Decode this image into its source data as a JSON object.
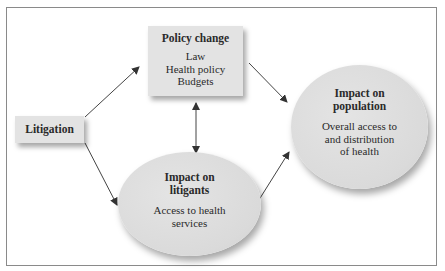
{
  "diagram": {
    "nodes": {
      "policy_change": {
        "title": "Policy change",
        "items": [
          "Law",
          "Health policy",
          "Budgets"
        ],
        "shape": "rectangle"
      },
      "litigation": {
        "title": "Litigation",
        "shape": "rectangle"
      },
      "impact_on_litigants": {
        "title_lines": [
          "Impact on",
          "litigants"
        ],
        "body_lines": [
          "Access to health",
          "services"
        ],
        "shape": "ellipse"
      },
      "impact_on_population": {
        "title_lines": [
          "Impact on",
          "population"
        ],
        "body_lines": [
          "Overall access to",
          "and distribution",
          "of health"
        ],
        "shape": "ellipse"
      }
    },
    "edges": [
      {
        "from": "Litigation",
        "to": "Policy change",
        "direction": "one-way"
      },
      {
        "from": "Litigation",
        "to": "Impact on litigants",
        "direction": "one-way"
      },
      {
        "from": "Policy change",
        "to": "Impact on litigants",
        "direction": "two-way"
      },
      {
        "from": "Policy change",
        "to": "Impact on population",
        "direction": "one-way"
      },
      {
        "from": "Impact on litigants",
        "to": "Impact on population",
        "direction": "one-way"
      }
    ],
    "colors": {
      "node_fill": "#e3e3e3",
      "frame_border": "#8a8a8a",
      "arrow": "#333333"
    }
  }
}
